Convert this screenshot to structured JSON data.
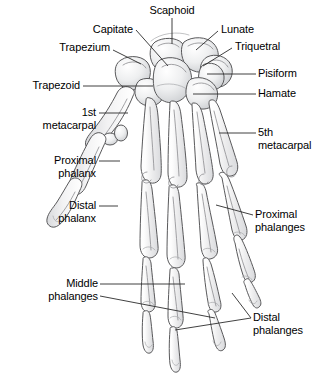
{
  "figure": {
    "view": "dorsal view of right hand skeleton",
    "colors": {
      "background": "#ffffff",
      "bone_fill": "#fbfbfb",
      "bone_shade": "#e2e3e5",
      "bone_shade_dark": "#cfd1d4",
      "outline": "#4a4a4a",
      "leader_line": "#2b2b2b",
      "label_text": "#000000"
    },
    "labels": [
      {
        "id": "scaphoid",
        "text": "Scaphoid",
        "lines": [
          "Scaphoid"
        ],
        "align": "c",
        "x": 143,
        "y": 4,
        "w": 58,
        "leader": [
          [
            172,
            18
          ],
          [
            172,
            44
          ]
        ]
      },
      {
        "id": "capitate",
        "text": "Capitate",
        "lines": [
          "Capitate"
        ],
        "align": "r",
        "x": 73,
        "y": 23,
        "w": 60,
        "leader": [
          [
            136,
            30
          ],
          [
            168,
            66
          ]
        ]
      },
      {
        "id": "lunate",
        "text": "Lunate",
        "lines": [
          "Lunate"
        ],
        "align": "l",
        "x": 221,
        "y": 23,
        "w": 54,
        "leader": [
          [
            218,
            31
          ],
          [
            196,
            50
          ]
        ]
      },
      {
        "id": "trapezium",
        "text": "Trapezium",
        "lines": [
          "Trapezium"
        ],
        "align": "r",
        "x": 46,
        "y": 41,
        "w": 64,
        "leader": [
          [
            113,
            50
          ],
          [
            141,
            64
          ]
        ]
      },
      {
        "id": "triquetral",
        "text": "Triquetral",
        "lines": [
          "Triquetral"
        ],
        "align": "l",
        "x": 235,
        "y": 40,
        "w": 60,
        "leader": [
          [
            232,
            48
          ],
          [
            203,
            66
          ]
        ]
      },
      {
        "id": "pisiform",
        "text": "Pisiform",
        "lines": [
          "Pisiform"
        ],
        "align": "l",
        "x": 258,
        "y": 67,
        "w": 52,
        "leader": [
          [
            256,
            74
          ],
          [
            207,
            74
          ]
        ]
      },
      {
        "id": "trapezoid",
        "text": "Trapezoid",
        "lines": [
          "Trapezoid"
        ],
        "align": "r",
        "x": 18,
        "y": 79,
        "w": 62,
        "leader": [
          [
            83,
            86
          ],
          [
            153,
            86
          ]
        ]
      },
      {
        "id": "hamate",
        "text": "Hamate",
        "lines": [
          "Hamate"
        ],
        "align": "l",
        "x": 258,
        "y": 87,
        "w": 48,
        "leader": [
          [
            256,
            94
          ],
          [
            193,
            94
          ]
        ]
      },
      {
        "id": "first-metacarpal",
        "text": "1st metacarpal",
        "lines": [
          "1st",
          "metacarpal"
        ],
        "align": "r",
        "x": 22,
        "y": 106,
        "w": 74,
        "leader": [
          [
            99,
            113
          ],
          [
            128,
            113
          ]
        ]
      },
      {
        "id": "fifth-metacarpal",
        "text": "5th metacarpal",
        "lines": [
          "5th",
          "metacarpal"
        ],
        "align": "l",
        "x": 258,
        "y": 126,
        "w": 62,
        "leader": [
          [
            256,
            133
          ],
          [
            219,
            133
          ]
        ]
      },
      {
        "id": "proximal-phalanx",
        "text": "Proximal phalanx",
        "lines": [
          "Proximal",
          "phalanx"
        ],
        "align": "r",
        "x": 22,
        "y": 154,
        "w": 74,
        "leader": [
          [
            99,
            161
          ],
          [
            120,
            161
          ]
        ]
      },
      {
        "id": "distal-phalanx",
        "text": "Distal phalanx",
        "lines": [
          "Distal",
          "phalanx"
        ],
        "align": "r",
        "x": 22,
        "y": 199,
        "w": 74,
        "leader": [
          [
            99,
            206
          ],
          [
            118,
            206
          ]
        ]
      },
      {
        "id": "proximal-phalanges",
        "text": "Proximal phalanges",
        "lines": [
          "Proximal",
          "phalanges"
        ],
        "align": "l",
        "x": 255,
        "y": 208,
        "w": 66,
        "leader": [
          [
            253,
            215
          ],
          [
            216,
            205
          ]
        ]
      },
      {
        "id": "middle-phalanges",
        "text": "Middle phalanges",
        "lines": [
          "Middle",
          "phalanges"
        ],
        "align": "r",
        "x": 18,
        "y": 277,
        "w": 80,
        "leader": [
          [
            100,
            284
          ],
          [
            185,
            284
          ]
        ],
        "leader2": [
          [
            100,
            296
          ],
          [
            215,
            318
          ]
        ]
      },
      {
        "id": "distal-phalanges",
        "text": "Distal phalanges",
        "lines": [
          "Distal",
          "phalanges"
        ],
        "align": "l",
        "x": 253,
        "y": 311,
        "w": 62,
        "leader": [
          [
            251,
            318
          ],
          [
            175,
            330
          ]
        ],
        "leader2": [
          [
            251,
            318
          ],
          [
            232,
            293
          ]
        ]
      }
    ]
  }
}
